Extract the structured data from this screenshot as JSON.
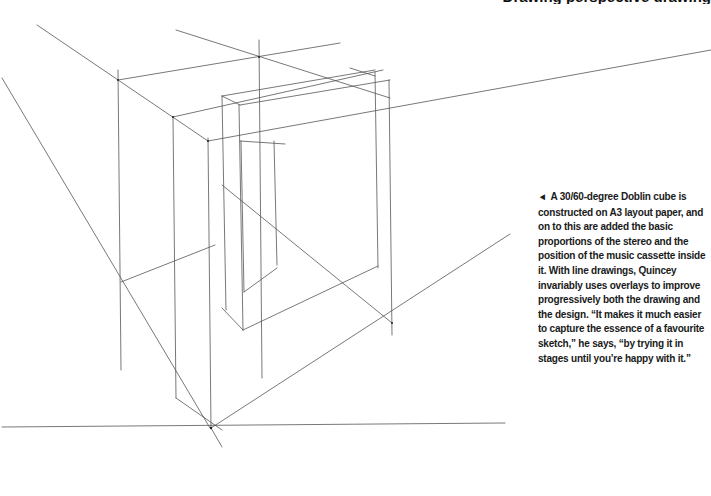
{
  "header": {
    "text": "Drawing perspective drawing"
  },
  "caption": {
    "pointer_icon": "◄",
    "text": "A 30/60-degree Doblin cube is constructed on A3 layout paper, and on to this are added the basic proportions of the stereo and the position of the music cassette inside it. With line drawings, Quincey invariably uses overlays to improve progressively both the drawing and the design. “It makes it much easier to capture the essence of a favourite sketch,” he says, “by trying it in stages until you’re happy with it.”"
  },
  "drawing": {
    "description": "Perspective line drawing of a Doblin cube with stereo and cassette outline",
    "stroke_color": "#555555"
  }
}
